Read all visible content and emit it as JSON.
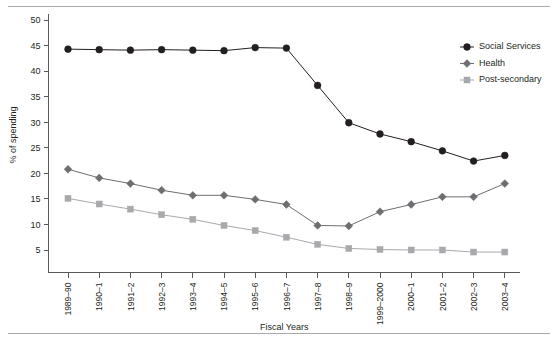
{
  "chart_data": {
    "type": "line",
    "title": "",
    "xlabel": "Fiscal Years",
    "ylabel": "% of spending",
    "categories": [
      "1989–90",
      "1990–1",
      "1991–2",
      "1992–3",
      "1993–4",
      "1994–5",
      "1995–6",
      "1996–7",
      "1997–8",
      "1998–9",
      "1999–2000",
      "2000–1",
      "2001–2",
      "2002–3",
      "2003–4"
    ],
    "ylim": [
      0,
      50
    ],
    "yticks": [
      5,
      10,
      15,
      20,
      25,
      30,
      35,
      40,
      45,
      50
    ],
    "grid": false,
    "legend_position": "right",
    "series": [
      {
        "name": "Social Services",
        "marker": "circle",
        "color": "#231f20",
        "values": [
          44.3,
          44.2,
          44.1,
          44.2,
          44.1,
          44.0,
          44.6,
          44.5,
          37.2,
          29.9,
          27.7,
          26.2,
          24.4,
          22.4,
          23.5
        ]
      },
      {
        "name": "Health",
        "marker": "diamond",
        "color": "#6d6e71",
        "values": [
          20.8,
          19.1,
          18.0,
          16.7,
          15.7,
          15.7,
          14.9,
          13.9,
          9.8,
          9.7,
          12.5,
          13.9,
          15.4,
          15.4,
          18.0
        ]
      },
      {
        "name": "Post-secondary",
        "marker": "square",
        "color": "#a7a9ac",
        "values": [
          15.1,
          14.0,
          13.0,
          11.9,
          11.0,
          9.8,
          8.8,
          7.5,
          6.1,
          5.3,
          5.1,
          5.0,
          5.0,
          4.6,
          4.6
        ]
      }
    ]
  },
  "legend": {
    "items": [
      {
        "label": "Social Services"
      },
      {
        "label": "Health"
      },
      {
        "label": "Post-secondary"
      }
    ]
  },
  "axes": {
    "y_label": "% of spending",
    "x_label": "Fiscal Years",
    "y_tick_labels": [
      "5",
      "10",
      "15",
      "20",
      "25",
      "30",
      "35",
      "40",
      "45",
      "50"
    ],
    "x_tick_labels": [
      "1989–90",
      "1990–1",
      "1991–2",
      "1992–3",
      "1993–4",
      "1994–5",
      "1995–6",
      "1996–7",
      "1997–8",
      "1998–9",
      "1999–2000",
      "2000–1",
      "2001–2",
      "2002–3",
      "2003–4"
    ]
  },
  "colors": {
    "social_services": "#231f20",
    "health": "#6d6e71",
    "post_secondary": "#a7a9ac",
    "axis": "#58595b",
    "rule": "#a7a9ac"
  }
}
